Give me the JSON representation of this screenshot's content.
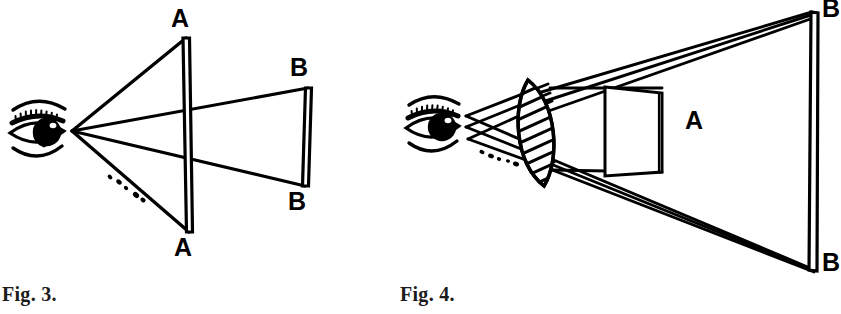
{
  "page": {
    "width": 841,
    "height": 314,
    "background": "#ffffff",
    "ink": "#000000"
  },
  "figures": [
    {
      "id": "fig-3",
      "caption": "Fig. 3.",
      "description": "Eye viewing object plane A and larger plane B without a lens; straight rays from the eye through A continue to B.",
      "labels": [
        {
          "name": "label-a-top",
          "text": "A"
        },
        {
          "name": "label-a-bottom",
          "text": "A"
        },
        {
          "name": "label-b-top",
          "text": "B"
        },
        {
          "name": "label-b-bottom",
          "text": "B"
        }
      ],
      "parts": [
        {
          "name": "eye-icon",
          "text": "eye-icon"
        },
        {
          "name": "plane-a",
          "text": "near plane A"
        },
        {
          "name": "plane-b",
          "text": "far plane B"
        },
        {
          "name": "ray-upper",
          "text": "upper sight ray"
        },
        {
          "name": "ray-middle",
          "text": "middle sight ray"
        },
        {
          "name": "ray-lower",
          "text": "lower sight ray"
        }
      ]
    },
    {
      "id": "fig-4",
      "caption": "Fig. 4.",
      "description": "Eye viewing object A through a biconvex lens; refracted rays diverge to a much larger apparent image plane B.",
      "labels": [
        {
          "name": "label-a",
          "text": "A"
        },
        {
          "name": "label-b-top",
          "text": "B"
        },
        {
          "name": "label-b-bottom",
          "text": "B"
        }
      ],
      "parts": [
        {
          "name": "eye-icon",
          "text": "eye-icon"
        },
        {
          "name": "lens-icon",
          "text": "biconvex-lens-icon"
        },
        {
          "name": "object-a",
          "text": "object A"
        },
        {
          "name": "plane-b",
          "text": "magnified image plane B"
        },
        {
          "name": "ray-bundle-up",
          "text": "upper refracted ray bundle"
        },
        {
          "name": "ray-bundle-dn",
          "text": "lower refracted ray bundle"
        }
      ]
    }
  ]
}
